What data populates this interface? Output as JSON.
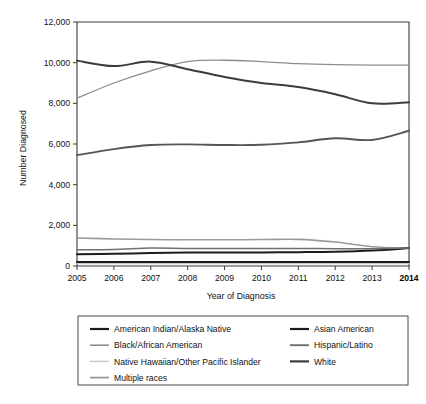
{
  "chart_data": {
    "type": "line",
    "title": "",
    "xlabel": "Year of Diagnosis",
    "ylabel": "Number Diagnosed",
    "x": [
      2005,
      2006,
      2007,
      2008,
      2009,
      2010,
      2011,
      2012,
      2013,
      2014
    ],
    "xticklabels": [
      "2005",
      "2006",
      "2007",
      "2008",
      "2009",
      "2010",
      "2011",
      "2012",
      "2013",
      "2014"
    ],
    "xtick_emphasis": "2014",
    "ylim": [
      0,
      12000
    ],
    "yticks": [
      0,
      2000,
      4000,
      6000,
      8000,
      10000,
      12000
    ],
    "yticklabels": [
      "0",
      "2,000",
      "4,000",
      "6,000",
      "8,000",
      "10,000",
      "12,000"
    ],
    "grid": false,
    "legend_position": "below-plot",
    "legend_columns": 2,
    "series": [
      {
        "name": "American Indian/Alaska Native",
        "color": "#1c1c1c",
        "width": 2.0,
        "values": [
          200,
          200,
          200,
          200,
          200,
          200,
          200,
          200,
          200,
          200
        ]
      },
      {
        "name": "Black/African American",
        "color": "#8d8d8d",
        "width": 1.3,
        "values": [
          8250,
          9000,
          9600,
          10050,
          10120,
          10050,
          9950,
          9900,
          9880,
          9880
        ]
      },
      {
        "name": "Native Hawaiian/Other Pacific Islander",
        "color": "#c9c9c9",
        "width": 1.3,
        "values": [
          120,
          120,
          120,
          120,
          120,
          120,
          120,
          120,
          120,
          120
        ]
      },
      {
        "name": "Multiple races",
        "color": "#9a9a9a",
        "width": 1.6,
        "values": [
          1380,
          1330,
          1300,
          1290,
          1290,
          1300,
          1310,
          1180,
          950,
          880
        ]
      },
      {
        "name": "Asian American",
        "color": "#1c1c1c",
        "width": 2.0,
        "values": [
          580,
          600,
          640,
          660,
          660,
          670,
          680,
          700,
          760,
          880
        ]
      },
      {
        "name": "Hispanic/Latino",
        "color": "#555555",
        "width": 1.9,
        "values": [
          5450,
          5750,
          5950,
          5980,
          5950,
          5960,
          6080,
          6280,
          6200,
          6650
        ]
      },
      {
        "name": "White",
        "color": "#3c3c3c",
        "width": 2.0,
        "values": [
          10100,
          9830,
          10050,
          9680,
          9300,
          9000,
          8800,
          8450,
          8000,
          8050
        ]
      },
      {
        "name": "Unlabeled low series",
        "color": "#707070",
        "width": 1.5,
        "values": [
          800,
          810,
          880,
          860,
          860,
          860,
          860,
          850,
          850,
          880
        ]
      }
    ],
    "legend_entries_left": [
      {
        "label": "American Indian/Alaska Native",
        "color": "#1c1c1c",
        "width": 2.2
      },
      {
        "label": "Black/African American",
        "color": "#8d8d8d",
        "width": 1.6
      },
      {
        "label": "Native Hawaiian/Other Pacific Islander",
        "color": "#c9c9c9",
        "width": 1.6
      },
      {
        "label": "Multiple races",
        "color": "#9a9a9a",
        "width": 1.8
      }
    ],
    "legend_entries_right": [
      {
        "label": "Asian American",
        "color": "#1c1c1c",
        "width": 2.2
      },
      {
        "label": "Hispanic/Latino",
        "color": "#6e6e6e",
        "width": 1.9
      },
      {
        "label": "White",
        "color": "#3c3c3c",
        "width": 2.2
      }
    ]
  },
  "colors": {
    "axis": "#3a3a3a",
    "text": "#111111",
    "background": "#ffffff",
    "legend_border": "#4a4a4a"
  }
}
